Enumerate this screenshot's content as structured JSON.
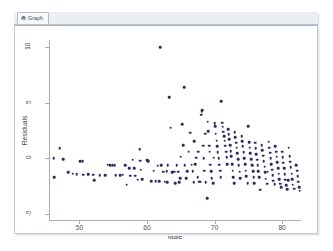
{
  "window": {
    "tab_label": "Graph",
    "tab_icon": "graph-icon"
  },
  "chart_data": {
    "type": "scatter",
    "title": "",
    "xlabel": "Male",
    "ylabel": "Residuals",
    "xlim": [
      45.5,
      82.8
    ],
    "ylim": [
      -5.6,
      10.6
    ],
    "xticks": [
      50,
      60,
      70,
      80
    ],
    "yticks": [
      10,
      5,
      0,
      -5
    ],
    "grid": false,
    "legend": "none",
    "marker": {
      "color": "#2b2d62",
      "shape": "circle",
      "size": 2.6
    },
    "n_points": 205,
    "points": [
      [
        46.2,
        0.0
      ],
      [
        46.3,
        -1.7
      ],
      [
        47.1,
        0.9
      ],
      [
        47.6,
        -0.05
      ],
      [
        48.3,
        -1.25
      ],
      [
        49.0,
        -1.35
      ],
      [
        49.6,
        -1.4
      ],
      [
        50.1,
        -0.25
      ],
      [
        50.5,
        -0.25
      ],
      [
        50.6,
        -1.45
      ],
      [
        51.3,
        -1.4
      ],
      [
        52.0,
        -1.45
      ],
      [
        52.2,
        -1.95
      ],
      [
        53.0,
        -1.5
      ],
      [
        53.8,
        -1.5
      ],
      [
        54.2,
        -0.55
      ],
      [
        54.6,
        -0.6
      ],
      [
        54.9,
        -0.6
      ],
      [
        55.2,
        -0.6
      ],
      [
        55.4,
        -1.5
      ],
      [
        56.0,
        -1.5
      ],
      [
        56.4,
        -1.45
      ],
      [
        57.0,
        -2.35
      ],
      [
        57.4,
        -0.85
      ],
      [
        57.5,
        -1.55
      ],
      [
        57.9,
        -0.1
      ],
      [
        58.1,
        -0.85
      ],
      [
        58.3,
        -1.55
      ],
      [
        58.6,
        -1.9
      ],
      [
        58.9,
        0.85
      ],
      [
        59.0,
        -0.2
      ],
      [
        59.1,
        -1.0
      ],
      [
        59.3,
        -1.85
      ],
      [
        60.0,
        -0.15
      ],
      [
        60.2,
        -0.25
      ],
      [
        60.6,
        -2.05
      ],
      [
        61.0,
        -1.1
      ],
      [
        61.3,
        -2.05
      ],
      [
        61.6,
        -0.65
      ],
      [
        62.0,
        9.95
      ],
      [
        62.1,
        -0.6
      ],
      [
        62.4,
        -1.2
      ],
      [
        62.6,
        -2.1
      ],
      [
        62.9,
        -1.15
      ],
      [
        63.1,
        -0.6
      ],
      [
        63.3,
        5.5
      ],
      [
        63.5,
        2.75
      ],
      [
        63.7,
        -1.25
      ],
      [
        63.9,
        -1.2
      ],
      [
        64.1,
        -1.2
      ],
      [
        64.4,
        -0.6
      ],
      [
        64.6,
        -1.2
      ],
      [
        64.9,
        -1.75
      ],
      [
        65.0,
        0.15
      ],
      [
        65.2,
        3.05
      ],
      [
        65.4,
        1.2
      ],
      [
        65.5,
        6.4
      ],
      [
        65.6,
        -0.6
      ],
      [
        65.8,
        -1.75
      ],
      [
        66.0,
        -1.15
      ],
      [
        66.2,
        0.6
      ],
      [
        66.4,
        2.3
      ],
      [
        66.6,
        -0.55
      ],
      [
        66.9,
        -2.15
      ],
      [
        67.0,
        1.55
      ],
      [
        67.1,
        -0.5
      ],
      [
        67.3,
        0.05
      ],
      [
        67.5,
        -1.7
      ],
      [
        67.7,
        -2.1
      ],
      [
        67.9,
        -2.1
      ],
      [
        68.0,
        3.9
      ],
      [
        68.1,
        4.2
      ],
      [
        68.2,
        4.3
      ],
      [
        68.3,
        1.15
      ],
      [
        68.4,
        0.0
      ],
      [
        68.5,
        -1.1
      ],
      [
        68.6,
        2.2
      ],
      [
        68.7,
        -2.15
      ],
      [
        68.9,
        -3.55
      ],
      [
        69.0,
        3.3
      ],
      [
        69.1,
        2.45
      ],
      [
        69.2,
        1.15
      ],
      [
        69.3,
        0.6
      ],
      [
        69.4,
        -0.55
      ],
      [
        69.5,
        -1.15
      ],
      [
        69.6,
        -1.75
      ],
      [
        69.8,
        -2.2
      ],
      [
        70.0,
        3.15
      ],
      [
        70.1,
        2.9
      ],
      [
        70.2,
        2.2
      ],
      [
        70.3,
        1.6
      ],
      [
        70.4,
        1.1
      ],
      [
        70.5,
        0.55
      ],
      [
        70.6,
        0.0
      ],
      [
        70.7,
        -0.55
      ],
      [
        70.8,
        -1.1
      ],
      [
        70.9,
        -1.7
      ],
      [
        71.0,
        5.1
      ],
      [
        71.1,
        3.2
      ],
      [
        71.2,
        2.85
      ],
      [
        71.3,
        2.4
      ],
      [
        71.4,
        2.0
      ],
      [
        71.5,
        1.6
      ],
      [
        71.6,
        1.15
      ],
      [
        71.7,
        0.6
      ],
      [
        71.8,
        0.1
      ],
      [
        71.9,
        -0.5
      ],
      [
        72.0,
        2.6
      ],
      [
        72.1,
        2.15
      ],
      [
        72.2,
        1.7
      ],
      [
        72.3,
        1.2
      ],
      [
        72.4,
        0.65
      ],
      [
        72.5,
        0.2
      ],
      [
        72.6,
        -0.5
      ],
      [
        72.7,
        -1.1
      ],
      [
        72.8,
        -1.7
      ],
      [
        73.0,
        2.35
      ],
      [
        73.1,
        1.9
      ],
      [
        73.2,
        1.4
      ],
      [
        73.3,
        0.95
      ],
      [
        73.4,
        0.45
      ],
      [
        73.5,
        -0.05
      ],
      [
        73.6,
        -0.6
      ],
      [
        73.7,
        -1.2
      ],
      [
        73.8,
        -1.75
      ],
      [
        74.0,
        2.0
      ],
      [
        74.1,
        1.55
      ],
      [
        74.2,
        1.1
      ],
      [
        74.3,
        0.55
      ],
      [
        74.4,
        0.0
      ],
      [
        74.5,
        -0.5
      ],
      [
        74.6,
        -1.1
      ],
      [
        74.7,
        -1.6
      ],
      [
        74.9,
        -2.2
      ],
      [
        75.0,
        2.9
      ],
      [
        75.1,
        1.45
      ],
      [
        75.2,
        0.95
      ],
      [
        75.3,
        0.45
      ],
      [
        75.4,
        -0.05
      ],
      [
        75.5,
        -0.55
      ],
      [
        75.6,
        -0.6
      ],
      [
        75.7,
        -1.15
      ],
      [
        75.8,
        -1.7
      ],
      [
        76.0,
        1.4
      ],
      [
        76.1,
        0.9
      ],
      [
        76.2,
        0.4
      ],
      [
        76.3,
        -0.1
      ],
      [
        76.4,
        -0.6
      ],
      [
        76.5,
        -1.15
      ],
      [
        76.6,
        -1.7
      ],
      [
        76.8,
        -2.8
      ],
      [
        77.0,
        1.2
      ],
      [
        77.1,
        0.75
      ],
      [
        77.2,
        0.25
      ],
      [
        77.3,
        -0.25
      ],
      [
        77.4,
        -0.75
      ],
      [
        77.5,
        -1.25
      ],
      [
        77.6,
        -1.8
      ],
      [
        77.8,
        -2.25
      ],
      [
        78.0,
        1.5
      ],
      [
        78.1,
        0.95
      ],
      [
        78.2,
        0.5
      ],
      [
        78.3,
        0.0
      ],
      [
        78.4,
        -0.5
      ],
      [
        78.5,
        -1.0
      ],
      [
        78.6,
        -1.5
      ],
      [
        78.7,
        -2.0
      ],
      [
        78.9,
        -2.3
      ],
      [
        79.0,
        1.1
      ],
      [
        79.1,
        0.6
      ],
      [
        79.2,
        0.15
      ],
      [
        79.3,
        -0.35
      ],
      [
        79.4,
        -0.85
      ],
      [
        79.5,
        -1.35
      ],
      [
        79.6,
        -1.85
      ],
      [
        79.7,
        -2.25
      ],
      [
        79.9,
        -2.55
      ],
      [
        80.0,
        0.6
      ],
      [
        80.1,
        0.1
      ],
      [
        80.2,
        -0.4
      ],
      [
        80.3,
        -0.9
      ],
      [
        80.4,
        -1.4
      ],
      [
        80.5,
        -1.9
      ],
      [
        80.6,
        -2.4
      ],
      [
        80.8,
        -2.75
      ],
      [
        81.0,
        0.95
      ],
      [
        81.1,
        0.2
      ],
      [
        81.2,
        -0.3
      ],
      [
        81.3,
        -0.8
      ],
      [
        81.4,
        -1.35
      ],
      [
        81.5,
        -1.85
      ],
      [
        81.6,
        -2.35
      ],
      [
        81.8,
        -2.7
      ],
      [
        82.0,
        -0.55
      ],
      [
        82.1,
        -0.6
      ],
      [
        82.2,
        -1.1
      ],
      [
        82.3,
        -1.6
      ],
      [
        82.4,
        -2.1
      ],
      [
        82.5,
        -2.6
      ],
      [
        82.6,
        -2.9
      ],
      [
        61.8,
        -2.05
      ],
      [
        63.0,
        -2.15
      ],
      [
        64.2,
        -2.2
      ],
      [
        64.8,
        -2.15
      ],
      [
        66.8,
        -1.15
      ],
      [
        67.6,
        0.6
      ],
      [
        69.9,
        0.05
      ],
      [
        72.9,
        -2.2
      ],
      [
        75.9,
        -2.2
      ],
      [
        77.9,
        -1.2
      ],
      [
        80.9,
        -1.95
      ],
      [
        56.8,
        -0.6
      ]
    ]
  }
}
